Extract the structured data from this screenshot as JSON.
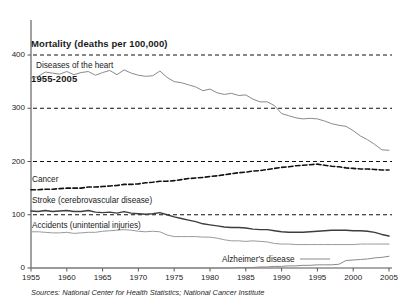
{
  "title": {
    "line1": "Mortality (deaths per 100,000)",
    "line2": "1955-2005"
  },
  "source": "Sources:  National Center for Health Statistics; National Cancer Institute",
  "axes": {
    "y_ticks": [
      "400",
      "300",
      "200",
      "100",
      "0"
    ],
    "x_ticks": [
      "1955",
      "1960",
      "1965",
      "1970",
      "1975",
      "1980",
      "1985",
      "1990",
      "1995",
      "2000",
      "2005"
    ]
  },
  "series_labels": {
    "heart": "Diseases of the heart",
    "cancer": "Cancer",
    "stroke": "Stroke  (cerebrovascular disease)",
    "accidents": "Accidents (unintential injuries)",
    "alzheimers": "Alzheimer's disease"
  },
  "colors": {
    "heart": "#8a8a8a",
    "cancer": "#111111",
    "stroke": "#3d3d3d",
    "accidents": "#9a9a9a",
    "alzheimers": "#8a8a8a",
    "gridline": "#111111",
    "axis": "#555555"
  },
  "chart_data": {
    "type": "line",
    "title": "Mortality (deaths per 100,000) 1955-2005",
    "xlabel": "",
    "ylabel": "Deaths per 100,000",
    "xlim": [
      1955,
      2005
    ],
    "ylim": [
      0,
      420
    ],
    "grid": "horizontal dashed at 100, 200, 300, 400",
    "legend": "inline labels on plot",
    "x": [
      1955,
      1956,
      1957,
      1958,
      1959,
      1960,
      1961,
      1962,
      1963,
      1964,
      1965,
      1966,
      1967,
      1968,
      1969,
      1970,
      1971,
      1972,
      1973,
      1974,
      1975,
      1976,
      1977,
      1978,
      1979,
      1980,
      1981,
      1982,
      1983,
      1984,
      1985,
      1986,
      1987,
      1988,
      1989,
      1990,
      1991,
      1992,
      1993,
      1994,
      1995,
      1996,
      1997,
      1998,
      1999,
      2000,
      2001,
      2002,
      2003,
      2004,
      2005
    ],
    "series": [
      {
        "name": "Diseases of the heart",
        "style": "solid-gray",
        "values": [
          356,
          360,
          368,
          366,
          364,
          369,
          363,
          367,
          369,
          362,
          367,
          371,
          363,
          372,
          366,
          362,
          360,
          361,
          370,
          358,
          350,
          348,
          344,
          340,
          333,
          336,
          329,
          326,
          328,
          324,
          325,
          317,
          312,
          312,
          305,
          290,
          286,
          282,
          280,
          281,
          280,
          276,
          271,
          268,
          266,
          258,
          248,
          241,
          232,
          222,
          221
        ]
      },
      {
        "name": "Cancer",
        "style": "dashed-black",
        "values": [
          147,
          147,
          148,
          148,
          149,
          150,
          150,
          150,
          152,
          152,
          153,
          154,
          155,
          157,
          157,
          158,
          160,
          161,
          163,
          163,
          164,
          166,
          168,
          169,
          170,
          172,
          173,
          175,
          177,
          179,
          180,
          182,
          183,
          185,
          187,
          189,
          190,
          192,
          193,
          194,
          195,
          193,
          191,
          190,
          188,
          187,
          186,
          186,
          185,
          184,
          184
        ]
      },
      {
        "name": "Stroke (cerebrovascular disease)",
        "style": "solid-darkgray",
        "values": [
          107,
          106,
          108,
          106,
          107,
          108,
          106,
          106,
          108,
          105,
          104,
          105,
          103,
          106,
          103,
          102,
          101,
          102,
          104,
          100,
          96,
          93,
          90,
          87,
          83,
          81,
          79,
          77,
          76,
          76,
          75,
          73,
          72,
          72,
          70,
          68,
          67,
          67,
          67,
          68,
          69,
          70,
          71,
          71,
          71,
          70,
          70,
          69,
          67,
          63,
          60
        ]
      },
      {
        "name": "Accidents (unintential injuries)",
        "style": "solid-lightgray",
        "values": [
          68,
          68,
          67,
          66,
          66,
          67,
          65,
          66,
          67,
          67,
          69,
          70,
          71,
          72,
          71,
          69,
          68,
          69,
          68,
          62,
          59,
          59,
          59,
          59,
          58,
          58,
          56,
          53,
          51,
          51,
          50,
          51,
          50,
          49,
          46,
          45,
          45,
          44,
          44,
          44,
          44,
          44,
          44,
          44,
          44,
          44,
          45,
          45,
          45,
          45,
          45
        ]
      },
      {
        "name": "Alzheimer's disease",
        "style": "solid-gray",
        "values": [
          0,
          0,
          0,
          0,
          0,
          0,
          0,
          0,
          0,
          0,
          0,
          0,
          0,
          0,
          0,
          0,
          0,
          0,
          0,
          0,
          0,
          0,
          0,
          0,
          0,
          0,
          0,
          0,
          0,
          1,
          1,
          1,
          2,
          2,
          3,
          3,
          4,
          4,
          5,
          5,
          6,
          6,
          6,
          7,
          14,
          15,
          16,
          17,
          19,
          20,
          22
        ]
      }
    ]
  }
}
